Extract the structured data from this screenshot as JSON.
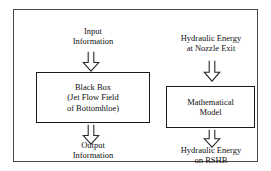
{
  "diagram": {
    "colors": {
      "background": "#ffffff",
      "frame_border": "#4a4a4a",
      "box_border": "#1a1a1a",
      "text": "#111111",
      "arrow_stroke": "#2a2a2a"
    },
    "left_branch": {
      "input_label": {
        "line1": "Input",
        "line2": "Information"
      },
      "box": {
        "line1": "Black Box",
        "line2": "(Jet Flow Field",
        "line3": "of Bottomhloe)"
      },
      "output_label": {
        "line1": "Output",
        "line2": "Information"
      },
      "arrows": [
        {
          "name": "input-arrow",
          "direction": "down"
        },
        {
          "name": "output-arrow",
          "direction": "down"
        }
      ]
    },
    "right_branch": {
      "input_label": {
        "line1": "Hydraulic Energy",
        "line2": "at Nozzle Exit"
      },
      "box": {
        "line1": "Mathematical",
        "line2": "Model"
      },
      "output_label": {
        "line1": "Hydraulic Energy",
        "line2": "on RSHB"
      },
      "arrows": [
        {
          "name": "hydraulic-input-arrow",
          "direction": "down"
        },
        {
          "name": "hydraulic-output-arrow",
          "direction": "down"
        }
      ]
    }
  }
}
